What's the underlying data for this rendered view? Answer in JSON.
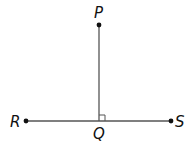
{
  "diagram": {
    "type": "geometry",
    "colors": {
      "stroke": "#555555",
      "point": "#111111",
      "label": "#111111",
      "background": "#ffffff"
    },
    "points": {
      "P": {
        "label": "P",
        "x": 99,
        "y": 25
      },
      "Q": {
        "label": "Q",
        "x": 99,
        "y": 121
      },
      "R": {
        "label": "R",
        "x": 26,
        "y": 121
      },
      "S": {
        "label": "S",
        "x": 171,
        "y": 121
      }
    },
    "segments": [
      {
        "from": "P",
        "to": "Q"
      },
      {
        "from": "R",
        "to": "S"
      }
    ],
    "right_angle_marker": {
      "at": "Q",
      "size": 6
    }
  }
}
